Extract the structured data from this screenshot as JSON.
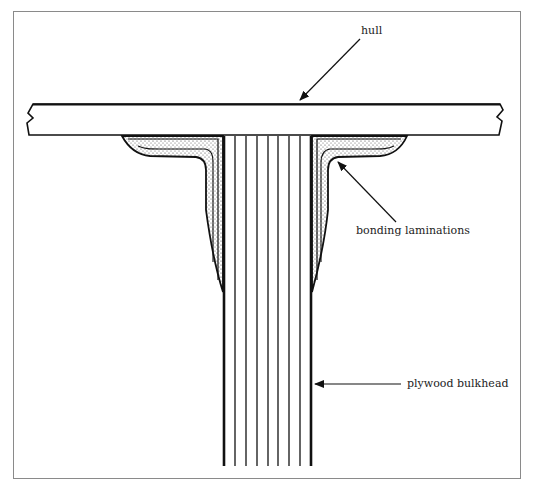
{
  "diagram": {
    "type": "cross-section",
    "labels": {
      "hull": "hull",
      "bonding": "bonding laminations",
      "bulkhead": "plywood bulkhead"
    },
    "colors": {
      "ink": "#111111",
      "frame": "#8a8a8a",
      "stipple": "#555555",
      "background": "#ffffff"
    },
    "bulkhead_plies": 9
  }
}
